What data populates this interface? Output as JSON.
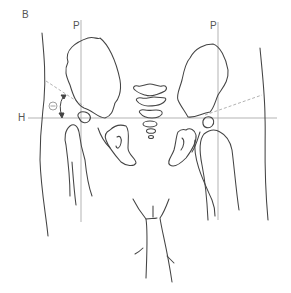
{
  "figure": {
    "panel_label": "B",
    "horizontal_line_label": "H",
    "perpendicular_line_left_label": "P",
    "perpendicular_line_right_label": "P",
    "angle_symbol": "θ"
  },
  "colors": {
    "outline": "#444444",
    "reference_line": "#aaaaaa",
    "dashed_line": "#aaaaaa",
    "label": "#555555"
  }
}
